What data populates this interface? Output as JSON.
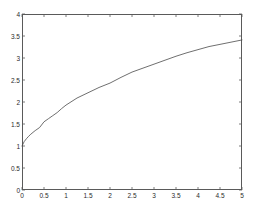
{
  "figure": {
    "background_color": "#ffffff",
    "axes_color": "#5a5a5a",
    "line_color": "#4a4a4a",
    "tick_label_color": "#2b2b2b"
  },
  "chart_data": {
    "type": "line",
    "title": "",
    "subtitle": "",
    "xlabel": "",
    "ylabel": "",
    "xlim": [
      0,
      5
    ],
    "ylim": [
      0,
      4
    ],
    "xticks": [
      0,
      0.5,
      1,
      1.5,
      2,
      2.5,
      3,
      3.5,
      4,
      4.5,
      5
    ],
    "xticklabels": [
      "0",
      "0.5",
      "1",
      "1.5",
      "2",
      "2.5",
      "3",
      "3.5",
      "4",
      "4.5",
      "5"
    ],
    "yticks": [
      0,
      0.5,
      1,
      1.5,
      2,
      2.5,
      3,
      3.5,
      4
    ],
    "yticklabels": [
      "0",
      "0.5",
      "1",
      "1.5",
      "2",
      "2.5",
      "3",
      "3.5",
      "4"
    ],
    "grid": false,
    "legend": null,
    "legend_position": "none",
    "annotations": [],
    "series": [
      {
        "name": "curve",
        "color": "#4a4a4a",
        "linewidth": 0.8,
        "x": [
          0.0,
          0.05,
          0.1,
          0.15,
          0.2,
          0.25,
          0.3,
          0.4,
          0.5,
          0.6,
          0.7,
          0.8,
          0.9,
          1.0,
          1.25,
          1.5,
          1.75,
          2.0,
          2.25,
          2.5,
          2.75,
          3.0,
          3.25,
          3.5,
          3.75,
          4.0,
          4.25,
          4.5,
          4.75,
          5.0
        ],
        "y": [
          1.0,
          1.1,
          1.165,
          1.22,
          1.268,
          1.31,
          1.35,
          1.42,
          1.55,
          1.62,
          1.69,
          1.76,
          1.85,
          1.93,
          2.09,
          2.21,
          2.33,
          2.43,
          2.56,
          2.68,
          2.77,
          2.86,
          2.95,
          3.04,
          3.12,
          3.19,
          3.26,
          3.31,
          3.36,
          3.41
        ]
      }
    ]
  }
}
